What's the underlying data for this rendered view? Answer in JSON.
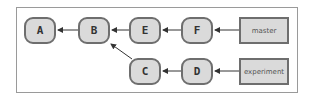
{
  "diagram": {
    "type": "git-commit-graph",
    "commits": [
      {
        "id": "A",
        "label": "A"
      },
      {
        "id": "B",
        "label": "B"
      },
      {
        "id": "E",
        "label": "E"
      },
      {
        "id": "F",
        "label": "F"
      },
      {
        "id": "C",
        "label": "C"
      },
      {
        "id": "D",
        "label": "D"
      }
    ],
    "branches": [
      {
        "name": "master",
        "label": "master",
        "points_to": "F"
      },
      {
        "name": "experiment",
        "label": "experiment",
        "points_to": "D"
      }
    ],
    "edges": [
      {
        "from": "B",
        "to": "A"
      },
      {
        "from": "E",
        "to": "B"
      },
      {
        "from": "F",
        "to": "E"
      },
      {
        "from": "C",
        "to": "B"
      },
      {
        "from": "D",
        "to": "C"
      },
      {
        "from": "master",
        "to": "F"
      },
      {
        "from": "experiment",
        "to": "D"
      }
    ],
    "colors": {
      "node_fill": "#dadada",
      "node_border": "#6e6e6e",
      "arrow": "#333333",
      "frame_border": "#9a9a9a"
    }
  }
}
